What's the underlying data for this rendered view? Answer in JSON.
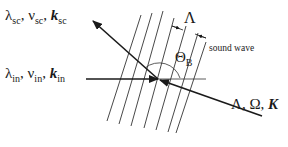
{
  "diagram": {
    "type": "Bragg acousto-optic diffraction schematic",
    "scattered": {
      "lambda": "λ",
      "lambda_sub": "sc",
      "nu": "ν",
      "nu_sub": "sc",
      "k": "k",
      "k_sub": "sc",
      "sep": ", "
    },
    "incident": {
      "lambda": "λ",
      "lambda_sub": "in",
      "nu": "ν",
      "nu_sub": "in",
      "k": "k",
      "k_sub": "in",
      "sep": ", "
    },
    "sound": {
      "wavelength": "Λ",
      "label": "Λ, Ω, ",
      "k": "K",
      "caption": "sound wave"
    },
    "angle": {
      "theta": "Θ",
      "theta_sub": "B"
    },
    "colors": {
      "ink": "#1a1a1a",
      "thin_line": "#333333",
      "background": "#ffffff"
    },
    "wavefront_count": 7
  }
}
